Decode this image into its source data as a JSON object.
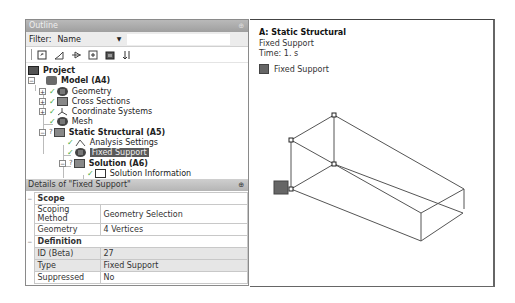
{
  "outline": {
    "title": "Outline",
    "pin_glyph": "⊕",
    "filter_label": "Filter:",
    "filter_value": "Name",
    "toolbar_icons": [
      "edit-icon",
      "expand-icon",
      "link-icon",
      "plus-box-icon",
      "folder-icon",
      "sort-icon"
    ],
    "tree": [
      {
        "label": "Project",
        "bold": true,
        "icon": "project-icon",
        "level": 0
      },
      {
        "label": "Model (A4)",
        "bold": true,
        "icon": "model-icon",
        "level": 1,
        "expander": "−"
      },
      {
        "label": "Geometry",
        "icon": "geometry-icon",
        "level": 2,
        "expander": "+",
        "status": "check"
      },
      {
        "label": "Cross Sections",
        "icon": "cross-sections-icon",
        "level": 2,
        "expander": "+",
        "status": "check"
      },
      {
        "label": "Coordinate Systems",
        "icon": "coordinate-systems-icon",
        "level": 2,
        "expander": "+",
        "status": "check"
      },
      {
        "label": "Mesh",
        "icon": "mesh-icon",
        "level": 2,
        "status": "check"
      },
      {
        "label": "Static Structural (A5)",
        "bold": true,
        "icon": "static-structural-icon",
        "level": 2,
        "expander": "−",
        "status": "?"
      },
      {
        "label": "Analysis Settings",
        "icon": "analysis-settings-icon",
        "level": 3,
        "status": "check"
      },
      {
        "label": "Fixed Support",
        "icon": "fixed-support-icon",
        "level": 3,
        "status": "check",
        "selected": true
      },
      {
        "label": "Solution (A6)",
        "bold": true,
        "icon": "solution-icon",
        "level": 3,
        "expander": "−",
        "status": "?"
      },
      {
        "label": "Solution Information",
        "icon": "solution-information-icon",
        "level": 4,
        "status": "check"
      }
    ]
  },
  "details": {
    "title": "Details of \"Fixed Support\"",
    "pin_glyph": "⊕",
    "groups": [
      {
        "name": "Scope",
        "rows": [
          {
            "key": "Scoping Method",
            "value": "Geometry Selection"
          },
          {
            "key": "Geometry",
            "value": "4 Vertices"
          }
        ]
      },
      {
        "name": "Definition",
        "rows": [
          {
            "key": "ID (Beta)",
            "value": "27",
            "shaded": true
          },
          {
            "key": "Type",
            "value": "Fixed Support",
            "shaded": true
          },
          {
            "key": "Suppressed",
            "value": "No"
          }
        ]
      }
    ],
    "collapse_glyph": "−"
  },
  "viewport": {
    "title": "A: Static Structural",
    "subtitle": "Fixed Support",
    "time": "Time: 1. s",
    "legend_label": "Fixed Support",
    "legend_color": "#666666"
  }
}
